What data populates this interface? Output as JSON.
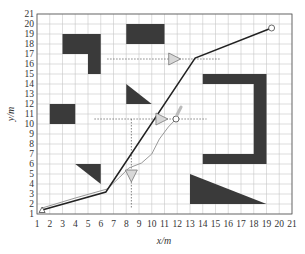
{
  "chart_data": {
    "type": "line",
    "title": "",
    "xlabel": "x/m",
    "ylabel": "y/m",
    "xlim": [
      1,
      21
    ],
    "ylim": [
      1,
      21
    ],
    "xticks": [
      1,
      2,
      3,
      4,
      5,
      6,
      7,
      8,
      9,
      10,
      11,
      12,
      13,
      14,
      15,
      16,
      17,
      18,
      19,
      20,
      21
    ],
    "yticks": [
      1,
      2,
      3,
      4,
      5,
      6,
      7,
      8,
      9,
      10,
      11,
      12,
      13,
      14,
      15,
      16,
      17,
      18,
      19,
      20,
      21
    ],
    "grid": true,
    "legend": null,
    "obstacles": [
      {
        "shape": "polygon",
        "points": [
          [
            3,
            19
          ],
          [
            6,
            19
          ],
          [
            6,
            15
          ],
          [
            5,
            15
          ],
          [
            5,
            17
          ],
          [
            3,
            17
          ]
        ]
      },
      {
        "shape": "polygon",
        "points": [
          [
            8,
            20
          ],
          [
            11,
            20
          ],
          [
            11,
            18
          ],
          [
            8,
            18
          ]
        ]
      },
      {
        "shape": "polygon",
        "points": [
          [
            8,
            14
          ],
          [
            8,
            12
          ],
          [
            10,
            12
          ]
        ]
      },
      {
        "shape": "polygon",
        "points": [
          [
            2,
            12
          ],
          [
            4,
            12
          ],
          [
            4,
            10
          ],
          [
            2,
            10
          ]
        ]
      },
      {
        "shape": "polygon",
        "points": [
          [
            4,
            6
          ],
          [
            6,
            6
          ],
          [
            6,
            4
          ]
        ]
      },
      {
        "shape": "polygon",
        "points": [
          [
            14,
            15
          ],
          [
            19,
            15
          ],
          [
            19,
            6
          ],
          [
            14,
            6
          ],
          [
            14,
            7
          ],
          [
            18,
            7
          ],
          [
            18,
            14
          ],
          [
            14,
            14
          ]
        ]
      },
      {
        "shape": "polygon",
        "points": [
          [
            13,
            5
          ],
          [
            13,
            2
          ],
          [
            19,
            2
          ]
        ]
      }
    ],
    "series": [
      {
        "name": "planned-path",
        "color": "#222222",
        "x": [
          1.4,
          6.4,
          13.4,
          19.4
        ],
        "y": [
          1.4,
          3.2,
          16.6,
          19.6
        ]
      },
      {
        "name": "actual-path",
        "color": "#999999",
        "x": [
          1.4,
          4.0,
          6.5,
          7.5,
          8.2,
          9.2,
          10.0,
          10.6,
          11.3,
          11.9
        ],
        "y": [
          1.6,
          2.6,
          3.5,
          4.7,
          5.6,
          6.1,
          7.0,
          8.5,
          9.7,
          10.5
        ]
      }
    ],
    "dynamic_obstacles": [
      {
        "name": "moving-obstacle-1",
        "x": 11.8,
        "y": 16.5,
        "direction": "right",
        "track": {
          "x": [
            6.5,
            15.4
          ],
          "y": [
            16.5,
            16.5
          ]
        }
      },
      {
        "name": "moving-obstacle-2",
        "x": 10.8,
        "y": 10.5,
        "direction": "right",
        "track": {
          "x": [
            5.5,
            14.3
          ],
          "y": [
            10.5,
            10.5
          ]
        }
      },
      {
        "name": "moving-obstacle-3",
        "x": 8.4,
        "y": 4.8,
        "direction": "down",
        "track": {
          "x": [
            8.4,
            8.4
          ],
          "y": [
            10.5,
            1.6
          ]
        }
      }
    ],
    "markers": [
      {
        "name": "start",
        "shape": "triangle",
        "x": 1.4,
        "y": 1.4
      },
      {
        "name": "goal",
        "shape": "circle",
        "x": 19.4,
        "y": 19.6
      },
      {
        "name": "robot-position",
        "shape": "circle",
        "x": 11.9,
        "y": 10.5
      },
      {
        "name": "heading-arrow",
        "shape": "arrow",
        "x": [
          11.9,
          12.3
        ],
        "y": [
          10.5,
          11.7
        ]
      }
    ]
  }
}
